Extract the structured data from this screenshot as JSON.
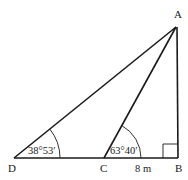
{
  "diagram": {
    "type": "trigonometry-triangle",
    "points": {
      "A": {
        "label": "A",
        "x": 176,
        "y": 27
      },
      "B": {
        "label": "B",
        "x": 178,
        "y": 158
      },
      "C": {
        "label": "C",
        "x": 104,
        "y": 158
      },
      "D": {
        "label": "D",
        "x": 14,
        "y": 158
      }
    },
    "segments": [
      {
        "from": "D",
        "to": "B"
      },
      {
        "from": "B",
        "to": "A"
      },
      {
        "from": "D",
        "to": "A"
      },
      {
        "from": "C",
        "to": "A"
      }
    ],
    "angles": {
      "D": {
        "label": "38°53′"
      },
      "C": {
        "label": "63°40′"
      },
      "B": {
        "type": "right-angle"
      }
    },
    "measurements": {
      "CB": {
        "label": "8 m"
      }
    },
    "colors": {
      "stroke": "#1a1a1a",
      "background": "#ffffff"
    }
  }
}
